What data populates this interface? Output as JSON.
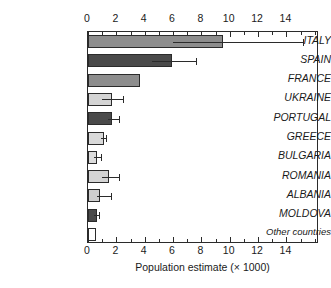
{
  "chart_data": {
    "type": "bar",
    "orientation": "horizontal",
    "title": "",
    "xlabel": "Population estimate (× 1000)",
    "ylabel": "",
    "xlim": [
      0,
      16.3
    ],
    "grid": false,
    "legend": "none",
    "x_major_ticks": [
      0,
      2,
      4,
      6,
      8,
      10,
      12,
      14
    ],
    "x_major_tick_labels": [
      "0",
      "2",
      "4",
      "6",
      "8",
      "10",
      "12",
      "14"
    ],
    "x_minor_tick_step": 1,
    "axis_positions": [
      "top",
      "bottom"
    ],
    "categories": [
      "ITALY",
      "SPAIN",
      "FRANCE",
      "UKRAINE",
      "PORTUGAL",
      "GREECE",
      "BULGARIA",
      "ROMANIA",
      "ALBANIA",
      "MOLDOVA",
      "Other countries"
    ],
    "values": [
      9.5,
      5.9,
      3.7,
      1.7,
      1.7,
      1.1,
      0.65,
      1.5,
      0.85,
      0.6,
      0.55
    ],
    "error_low": [
      6.0,
      4.5,
      null,
      1.0,
      1.4,
      0.9,
      0.4,
      1.0,
      0.6,
      0.45,
      null
    ],
    "error_high": [
      15.2,
      7.6,
      null,
      2.5,
      2.2,
      1.3,
      0.95,
      2.2,
      1.6,
      0.8,
      null
    ],
    "bar_fill_colors": [
      "#8d8d8d",
      "#4a4a4a",
      "#8d8d8d",
      "#d4d4d4",
      "#4a4a4a",
      "#d9d9d9",
      "#dcdcdc",
      "#d4d4d4",
      "#cfcfcf",
      "#4a4a4a",
      "#ffffff"
    ],
    "bar_edge_color": "#2b2b2b",
    "error_bar_color": "#2b2b2b",
    "frame_color": "#2b2b2b",
    "background": "#ffffff"
  }
}
